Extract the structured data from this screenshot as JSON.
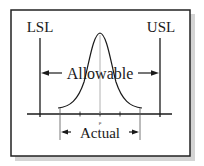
{
  "diagram": {
    "labels": {
      "lsl": "LSL",
      "usl": "USL",
      "allowable": "Allowable",
      "actual": "Actual",
      "mean": "μ"
    },
    "colors": {
      "frame": "#222222",
      "shadow": "#c8c8c8",
      "ink": "#1a1a1a",
      "center_line": "#9a9a9a",
      "background": "#ffffff"
    },
    "elements": {
      "lower_spec_limit": "LSL vertical line",
      "upper_spec_limit": "USL vertical line",
      "distribution": "normal bell curve centered at mean",
      "axis": "horizontal axis with tick marks",
      "allowable_span": "double arrow between LSL and USL",
      "actual_span": "double arrow spanning the curve's tails"
    }
  }
}
